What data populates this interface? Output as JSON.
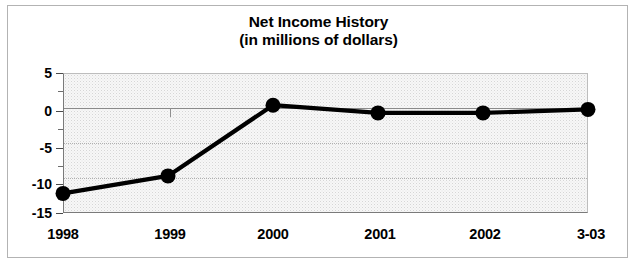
{
  "chart_data": {
    "type": "line",
    "title": "Net Income History",
    "subtitle": "(in millions of dollars)",
    "xlabel": "",
    "ylabel": "",
    "categories": [
      "1998",
      "1999",
      "2000",
      "2001",
      "2002",
      "3-03"
    ],
    "values": [
      -12.2,
      -9.7,
      0.4,
      -0.7,
      -0.7,
      -0.2
    ],
    "series": [
      {
        "name": "Net Income",
        "values": [
          -12.2,
          -9.7,
          0.4,
          -0.7,
          -0.7,
          -0.2
        ]
      }
    ],
    "ylim": [
      -15,
      5
    ],
    "yticks": [
      5,
      0,
      -5,
      -10,
      -15
    ],
    "ytick_labels": [
      "5",
      "0",
      "-5",
      "-10",
      "-15"
    ],
    "yminor_ticks": [
      2.5,
      -2.5,
      -7.5,
      -12.5
    ],
    "grid": "horizontal-dotted",
    "zero_line": true,
    "legend": "none",
    "marker": "filled-circle",
    "line_color": "#000000",
    "marker_color": "#000000",
    "plot_background": "#f7f7f7",
    "frame_color": "#b3b3b3"
  },
  "figure": {
    "title_line1": "Net Income History",
    "title_line2": "(in millions of dollars)"
  },
  "axes": {
    "y_labels": [
      "5",
      "0",
      "-5",
      "-10",
      "-15"
    ],
    "x_labels": [
      "1998",
      "1999",
      "2000",
      "2001",
      "2002",
      "3-03"
    ]
  }
}
